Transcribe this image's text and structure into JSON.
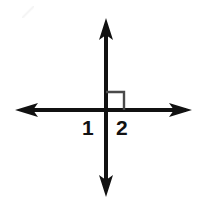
{
  "figure": {
    "type": "geometry-diagram",
    "background_color": "#ffffff",
    "stroke_color": "#111111",
    "marker_color": "#4a4a4a",
    "canvas": {
      "width": 203,
      "height": 202
    },
    "intersection": {
      "x": 106,
      "y": 110
    },
    "lines": [
      {
        "name": "vertical-line",
        "orientation": "vertical",
        "x1": 106,
        "y1": 20,
        "x2": 106,
        "y2": 195,
        "arrow_start": true,
        "arrow_end": true,
        "stroke_width": 4
      },
      {
        "name": "horizontal-line",
        "orientation": "horizontal",
        "x1": 18,
        "y1": 110,
        "x2": 190,
        "y2": 110,
        "arrow_start": true,
        "arrow_end": true,
        "stroke_width": 4
      }
    ],
    "right_angle_marker": {
      "name": "right-angle-square",
      "quadrant": "upper-right",
      "x": 106,
      "y": 92,
      "size": 18,
      "stroke_width": 2
    },
    "labels": [
      {
        "id": "label-1",
        "text": "1",
        "quadrant": "lower-left",
        "x": 82,
        "y": 117
      },
      {
        "id": "label-2",
        "text": "2",
        "quadrant": "lower-right",
        "x": 116,
        "y": 117
      }
    ]
  }
}
